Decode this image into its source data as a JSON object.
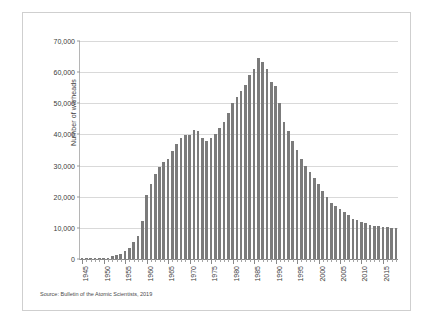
{
  "figure": {
    "y_axis_title": "Number of warheads",
    "source_note": "Source: Bulletin of the Atomic Scientists, 2019"
  },
  "chart_data": {
    "type": "bar",
    "title": "",
    "subtitle": "",
    "xlabel": "",
    "ylabel": "Number of warheads",
    "ylim": [
      0,
      70000
    ],
    "xlim": [
      1945,
      2018
    ],
    "grid": true,
    "legend": false,
    "bar_color": "#7b7b7b",
    "y_ticks": [
      0,
      10000,
      20000,
      30000,
      40000,
      50000,
      60000,
      70000
    ],
    "y_tick_labels": [
      "0",
      "10,000",
      "20,000",
      "30,000",
      "40,000",
      "50,000",
      "60,000",
      "70,000"
    ],
    "x_tick_labels": [
      "1945",
      "1950",
      "1955",
      "1960",
      "1965",
      "1970",
      "1975",
      "1980",
      "1985",
      "1990",
      "1995",
      "2000",
      "2005",
      "2010",
      "2015"
    ],
    "x_tick_values": [
      1945,
      1950,
      1955,
      1960,
      1965,
      1970,
      1975,
      1980,
      1985,
      1990,
      1995,
      2000,
      2005,
      2010,
      2015
    ],
    "categories": [
      1945,
      1946,
      1947,
      1948,
      1949,
      1950,
      1951,
      1952,
      1953,
      1954,
      1955,
      1956,
      1957,
      1958,
      1959,
      1960,
      1961,
      1962,
      1963,
      1964,
      1965,
      1966,
      1967,
      1968,
      1969,
      1970,
      1971,
      1972,
      1973,
      1974,
      1975,
      1976,
      1977,
      1978,
      1979,
      1980,
      1981,
      1982,
      1983,
      1984,
      1985,
      1986,
      1987,
      1988,
      1989,
      1990,
      1991,
      1992,
      1993,
      1994,
      1995,
      1996,
      1997,
      1998,
      1999,
      2000,
      2001,
      2002,
      2003,
      2004,
      2005,
      2006,
      2007,
      2008,
      2009,
      2010,
      2011,
      2012,
      2013,
      2014,
      2015,
      2016,
      2017,
      2018
    ],
    "values": [
      2,
      9,
      13,
      50,
      170,
      299,
      438,
      832,
      1161,
      1703,
      2422,
      3692,
      5543,
      7345,
      12298,
      20434,
      24111,
      27387,
      29459,
      31056,
      32040,
      34804,
      36800,
      38974,
      39691,
      39691,
      41365,
      41000,
      39000,
      38000,
      39000,
      40000,
      42000,
      44000,
      47000,
      50000,
      52000,
      54000,
      56000,
      59000,
      61000,
      64449,
      63400,
      61000,
      57000,
      55500,
      50000,
      44000,
      41000,
      38000,
      35000,
      32000,
      30000,
      28000,
      26000,
      24000,
      22000,
      20000,
      18000,
      17000,
      16000,
      15000,
      14000,
      13000,
      12500,
      12000,
      11500,
      11000,
      10700,
      10500,
      10300,
      10200,
      10100,
      10000
    ],
    "annotations": []
  }
}
